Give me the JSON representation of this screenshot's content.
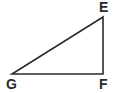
{
  "figure": {
    "kind": "geometry-diagram",
    "shape_name": "right-triangle",
    "background_color": "#ffffff",
    "stroke_color": "#2b2b2b",
    "stroke_width": 1.6,
    "canvas": {
      "width": 116,
      "height": 93
    },
    "vertices": [
      {
        "id": "E",
        "label": "E",
        "x": 103,
        "y": 17,
        "label_x": 99,
        "label_y": 0
      },
      {
        "id": "F",
        "label": "F",
        "x": 103,
        "y": 74,
        "label_x": 99,
        "label_y": 77
      },
      {
        "id": "G",
        "label": "G",
        "x": 12,
        "y": 74,
        "label_x": 6,
        "label_y": 77
      }
    ],
    "edges": [
      {
        "id": "EF",
        "from": "E",
        "to": "F",
        "name": "vertical-leg"
      },
      {
        "id": "FG",
        "from": "F",
        "to": "G",
        "name": "horizontal-leg"
      },
      {
        "id": "GE",
        "from": "G",
        "to": "E",
        "name": "hypotenuse"
      }
    ],
    "right_angle_at": "F",
    "polygon_points": "103,17 103,74 12,74"
  }
}
